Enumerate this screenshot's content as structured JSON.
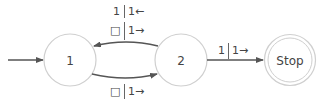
{
  "diagram": {
    "type": "turing-machine-state-diagram",
    "states": [
      {
        "id": "1",
        "label": "1",
        "start": true,
        "accepting": false
      },
      {
        "id": "2",
        "label": "2",
        "start": false,
        "accepting": false
      },
      {
        "id": "stop",
        "label": "Stop",
        "start": false,
        "accepting": true
      }
    ],
    "transitions": [
      {
        "from": "2",
        "to": "1",
        "lines": [
          "1 | 1←",
          "□ | 1→"
        ]
      },
      {
        "from": "1",
        "to": "2",
        "lines": [
          "□ | 1→"
        ]
      },
      {
        "from": "2",
        "to": "stop",
        "lines": [
          "1 | 1→"
        ]
      }
    ]
  },
  "labels": {
    "t21_line1_read": "1",
    "t21_line1_write": "1←",
    "t21_line2_read": "□",
    "t21_line2_write": "1→",
    "t12_read": "□",
    "t12_write": "1→",
    "t2s_read": "1",
    "t2s_write": "1→"
  },
  "colors": {
    "circle_stroke": "#cfcfcf",
    "edge": "#555555",
    "text": "#444444"
  }
}
